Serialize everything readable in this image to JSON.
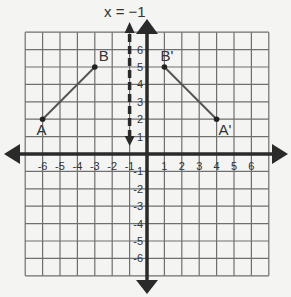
{
  "diagram": {
    "title": "x = −1",
    "reflection_line": {
      "label": "x = −1",
      "x": -1,
      "style": "dashed"
    },
    "grid": {
      "xmin": -7,
      "xmax": 7,
      "ymin": -7,
      "ymax": 7,
      "step": 1
    },
    "x_tick_labels": [
      "-6",
      "-5",
      "-4",
      "-3",
      "-2",
      "-1",
      "1",
      "2",
      "3",
      "4",
      "5",
      "6"
    ],
    "y_tick_labels": [
      "6",
      "5",
      "4",
      "3",
      "2",
      "1",
      "-1",
      "-2",
      "-3",
      "-4",
      "-5",
      "-6"
    ],
    "points": [
      {
        "label": "A",
        "x": -6,
        "y": 2
      },
      {
        "label": "B",
        "x": -3,
        "y": 5
      },
      {
        "label": "B'",
        "x": 1,
        "y": 5
      },
      {
        "label": "A'",
        "x": 4,
        "y": 2
      }
    ],
    "segments": [
      {
        "name": "AB",
        "from": "A",
        "to": "B"
      },
      {
        "name": "A'B'",
        "from": "B'",
        "to": "A'"
      }
    ],
    "colors": {
      "grid": "#6f6f6f",
      "axis": "#2a2a2a",
      "segment": "#555555",
      "background": "#f4f4f2"
    }
  }
}
